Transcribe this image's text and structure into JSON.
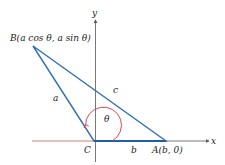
{
  "diagram": {
    "type": "geometry-triangle-on-axes",
    "axes": {
      "x_label": "x",
      "y_label": "y"
    },
    "points": {
      "B": {
        "label": "B(a cos θ, a sin θ)"
      },
      "C": {
        "label": "C"
      },
      "A": {
        "label": "A(b, 0)"
      }
    },
    "sides": {
      "a": "a",
      "b": "b",
      "c": "c"
    },
    "angle": {
      "label": "θ",
      "vertex": "C"
    },
    "colors": {
      "triangle": "#2f6fb8",
      "angle_arc": "#d9343a",
      "axes": "#555555",
      "negative_x_axis": "#d9343a"
    }
  }
}
